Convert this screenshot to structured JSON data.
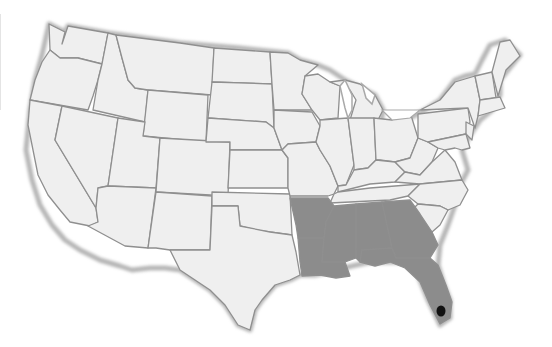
{
  "map": {
    "title": "",
    "subject": "United States (contiguous)",
    "colors": {
      "background": "#ffffff",
      "land": "#eeeeee",
      "highlighted_region": "#8c8c8c",
      "highlight_point": "#111111",
      "border": "#8f8f8f",
      "coast_shadow": "#a9a9a9"
    },
    "highlighted_states": [
      "Arkansas",
      "Louisiana",
      "Mississippi",
      "Alabama",
      "Georgia",
      "Florida"
    ],
    "highlight_point": {
      "label": "South Florida (Everglades)",
      "x": 433,
      "y": 316
    }
  }
}
